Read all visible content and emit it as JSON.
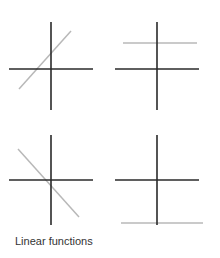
{
  "caption": "Linear functions",
  "colors": {
    "axis": "#2a2a2a",
    "function_line": "#b8b8b8",
    "background": "#ffffff"
  },
  "panels": [
    {
      "id": "top-left",
      "description": "increasing line (positive slope, positive intercept)",
      "axes": {
        "v": [
          51,
          22,
          51,
          110
        ],
        "h": [
          9,
          69,
          93,
          69
        ]
      },
      "line": [
        19,
        89,
        71,
        31
      ]
    },
    {
      "id": "top-right",
      "description": "constant function above x-axis",
      "axes": {
        "v": [
          157,
          22,
          157,
          110
        ],
        "h": [
          115,
          69,
          199,
          69
        ]
      },
      "line": [
        123,
        43,
        197,
        43
      ]
    },
    {
      "id": "bottom-left",
      "description": "decreasing line through origin",
      "axes": {
        "v": [
          51,
          135,
          51,
          225
        ],
        "h": [
          9,
          180,
          93,
          180
        ]
      },
      "line": [
        18,
        149,
        79,
        217
      ]
    },
    {
      "id": "bottom-right",
      "description": "constant function below x-axis",
      "axes": {
        "v": [
          157,
          135,
          157,
          225
        ],
        "h": [
          115,
          180,
          199,
          180
        ]
      },
      "line": [
        121,
        223,
        203,
        223
      ]
    }
  ]
}
